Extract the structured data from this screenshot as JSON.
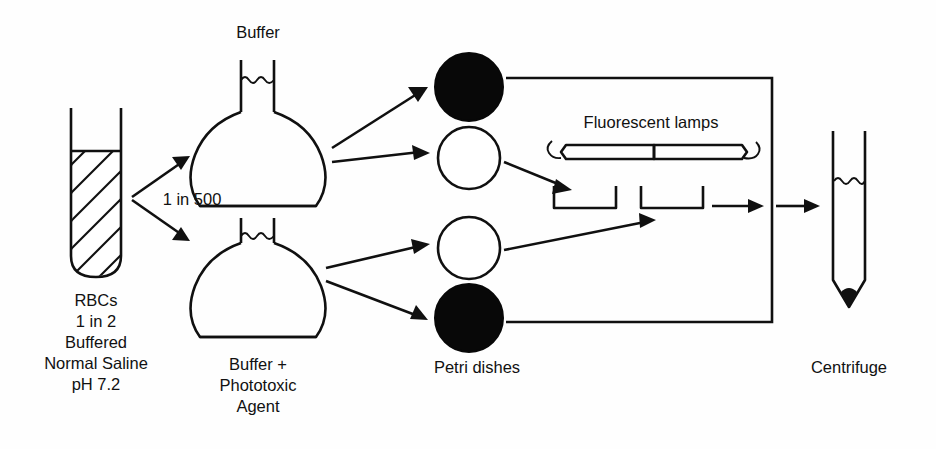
{
  "figure": {
    "type": "laboratory-flow-diagram",
    "background_color": "#fefefe",
    "ink_color": "#101010",
    "width": 936,
    "height": 449
  },
  "labels": {
    "buffer_flask": "Buffer",
    "phototoxic_flask_line1": "Buffer +",
    "phototoxic_flask_line2": "Phototoxic",
    "phototoxic_flask_line3": "Agent",
    "dilution": "1 in 500",
    "source_line1": "RBCs",
    "source_line2": "1 in 2",
    "source_line3": "Buffered",
    "source_line4": "Normal Saline",
    "source_line5": "pH 7.2",
    "petri_dishes": "Petri dishes",
    "fluorescent_lamps": "Fluorescent lamps",
    "centrifuge": "Centrifuge"
  },
  "nodes": {
    "source_tube": {
      "name": "RBC suspension test tube",
      "fill_pattern": "diagonal-hatch",
      "x": 70,
      "y": 108,
      "width": 52,
      "height": 168
    },
    "flask_buffer": {
      "name": "round bottom flask with buffer",
      "cx": 258,
      "cy": 165,
      "liquid_line": "wavy"
    },
    "flask_phototoxic": {
      "name": "round bottom flask with buffer plus phototoxic agent",
      "cx": 258,
      "cy": 290,
      "liquid_line": "wavy"
    },
    "centrifuge_tube": {
      "name": "conical centrifuge tube",
      "cx": 849,
      "cy": 215,
      "liquid_line": "wavy",
      "pellet": true
    }
  },
  "petri_dishes": [
    {
      "index": 1,
      "state": "dark",
      "label": "covered / dark control",
      "cx": 469,
      "cy": 87,
      "r": 34
    },
    {
      "index": 2,
      "state": "open",
      "label": "irradiated",
      "cx": 469,
      "cy": 158,
      "r": 31
    },
    {
      "index": 3,
      "state": "open",
      "label": "irradiated",
      "cx": 469,
      "cy": 248,
      "r": 31
    },
    {
      "index": 4,
      "state": "dark",
      "label": "covered / dark control",
      "cx": 469,
      "cy": 318,
      "r": 34
    }
  ],
  "lamps": [
    {
      "index": 1,
      "x1": 560,
      "x2": 654,
      "y": 152
    },
    {
      "index": 2,
      "x1": 654,
      "x2": 742,
      "y": 152
    }
  ],
  "irradiation_trays": [
    {
      "index": 1,
      "x": 554,
      "y": 186,
      "width": 62,
      "height": 22
    },
    {
      "index": 2,
      "x": 641,
      "y": 186,
      "width": 62,
      "height": 22
    }
  ],
  "flow_edges": [
    {
      "from": "source_tube",
      "to": "flask_buffer",
      "style": "arrow",
      "label": "1 in 500"
    },
    {
      "from": "source_tube",
      "to": "flask_phototoxic",
      "style": "arrow",
      "label": "1 in 500"
    },
    {
      "from": "flask_buffer",
      "to": "dish_1",
      "style": "arrow"
    },
    {
      "from": "flask_buffer",
      "to": "dish_2",
      "style": "arrow"
    },
    {
      "from": "flask_phototoxic",
      "to": "dish_3",
      "style": "arrow"
    },
    {
      "from": "flask_phototoxic",
      "to": "dish_4",
      "style": "arrow"
    },
    {
      "from": "dish_1",
      "to": "collector_bus",
      "style": "plain-line"
    },
    {
      "from": "dish_4",
      "to": "collector_bus",
      "style": "plain-line"
    },
    {
      "from": "dish_2",
      "to": "tray_1",
      "style": "arrow"
    },
    {
      "from": "dish_3",
      "to": "tray_2",
      "style": "arrow"
    },
    {
      "from": "tray_2",
      "to": "collector_bus",
      "style": "arrow"
    },
    {
      "from": "collector_bus",
      "to": "centrifuge_tube",
      "style": "arrow"
    }
  ],
  "collector_bus": {
    "x": 772,
    "y_top": 89,
    "y_bottom": 322
  }
}
